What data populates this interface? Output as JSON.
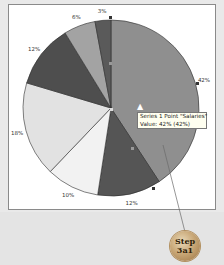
{
  "chart_data": {
    "type": "pie",
    "title": "",
    "series_name": "Series 1",
    "categories": [
      "Salaries",
      "Slice 2",
      "Slice 3",
      "Slice 4",
      "Slice 5",
      "Slice 6",
      "Slice 7"
    ],
    "values": [
      42,
      12,
      10,
      18,
      12,
      6,
      3
    ],
    "labels": [
      "42%",
      "12%",
      "10%",
      "18%",
      "12%",
      "6%",
      "3%"
    ],
    "colors": [
      "#8f8f8f",
      "#555555",
      "#f2f2f2",
      "#e2e2e2",
      "#4e4e4e",
      "#a3a3a3",
      "#5a5a5a"
    ],
    "legend": "none",
    "grid": false
  },
  "tooltip": {
    "line1": "Series 1 Point \"Salaries\"",
    "line2": "Value: 42% (42%)"
  },
  "step_badge": {
    "line1": "Step",
    "line2": "3a1"
  }
}
